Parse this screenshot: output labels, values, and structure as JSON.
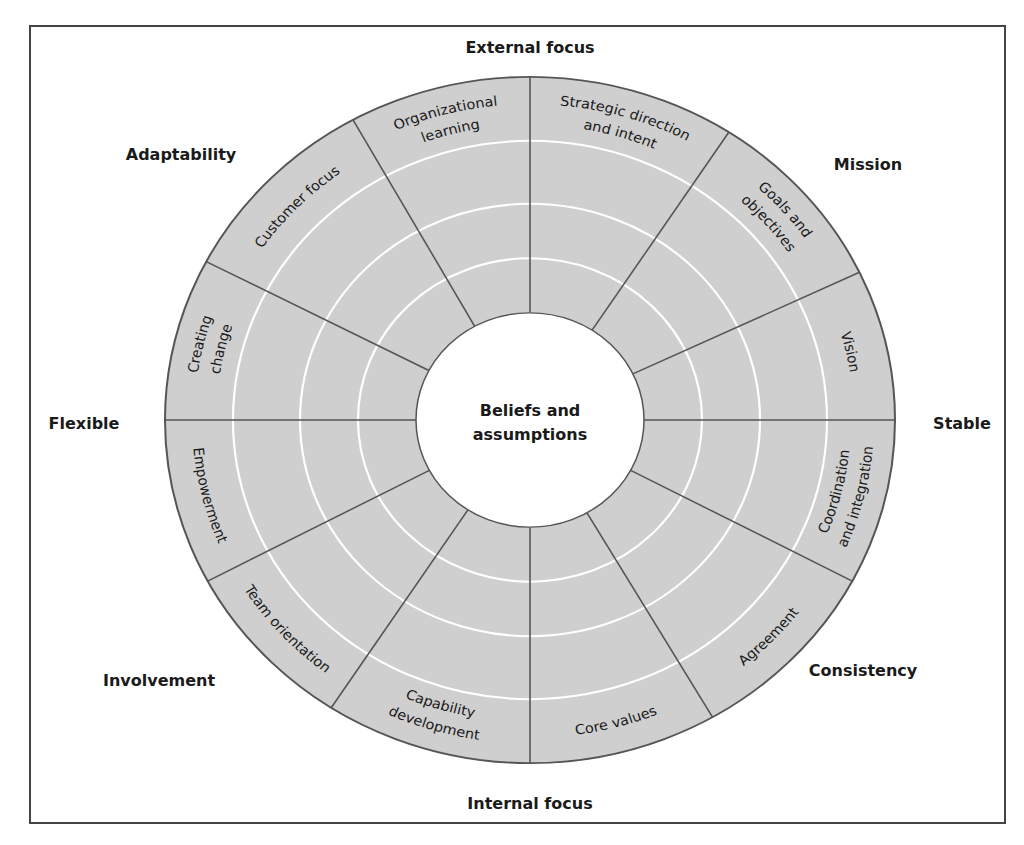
{
  "diagram": {
    "center": {
      "line1": "Beliefs and",
      "line2": "assumptions"
    },
    "axes": {
      "top": "External focus",
      "bottom": "Internal focus",
      "left": "Flexible",
      "right": "Stable"
    },
    "traits": {
      "top_left": "Adaptability",
      "top_right": "Mission",
      "bottom_left": "Involvement",
      "bottom_right": "Consistency"
    },
    "segments": [
      {
        "trait": "Mission",
        "lines": [
          "Vision"
        ]
      },
      {
        "trait": "Mission",
        "lines": [
          "Goals and",
          "objectives"
        ]
      },
      {
        "trait": "Mission",
        "lines": [
          "Strategic direction",
          "and intent"
        ]
      },
      {
        "trait": "Adaptability",
        "lines": [
          "Organizational",
          "learning"
        ]
      },
      {
        "trait": "Adaptability",
        "lines": [
          "Customer focus"
        ]
      },
      {
        "trait": "Adaptability",
        "lines": [
          "Creating",
          "change"
        ]
      },
      {
        "trait": "Involvement",
        "lines": [
          "Empowerment"
        ]
      },
      {
        "trait": "Involvement",
        "lines": [
          "Team orientation"
        ]
      },
      {
        "trait": "Involvement",
        "lines": [
          "Capability",
          "development"
        ]
      },
      {
        "trait": "Consistency",
        "lines": [
          "Core values"
        ]
      },
      {
        "trait": "Consistency",
        "lines": [
          "Agreement"
        ]
      },
      {
        "trait": "Consistency",
        "lines": [
          "Coordination",
          "and integration"
        ]
      }
    ],
    "colors": {
      "fill": "#cfcfcf",
      "stroke": "#555555",
      "rings": "#ffffff",
      "text": "#1a1a1a",
      "frame": "#444444"
    }
  }
}
